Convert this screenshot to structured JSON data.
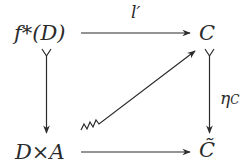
{
  "diagram": {
    "type": "commutative-diagram",
    "nodes": {
      "top_left": "f*(D)",
      "top_right": "C",
      "bottom_left": "D×A",
      "bottom_right": "C̃"
    },
    "edges": {
      "top": {
        "from": "f*(D)",
        "to": "C",
        "label": "l′",
        "style": "arrow"
      },
      "left": {
        "from": "f*(D)",
        "to": "D×A",
        "label": "",
        "style": "monic-arrow"
      },
      "right": {
        "from": "C",
        "to": "C̃",
        "label_main": "η",
        "label_sub": "C",
        "style": "monic-arrow"
      },
      "bottom": {
        "from": "D×A",
        "to": "C̃",
        "label": "",
        "style": "arrow"
      },
      "diagonal": {
        "from": "D×A",
        "to": "C",
        "label": "",
        "style": "squiggle-arrow"
      }
    },
    "colors": {
      "ink": "#2b2b2b",
      "background": "#ffffff"
    }
  }
}
